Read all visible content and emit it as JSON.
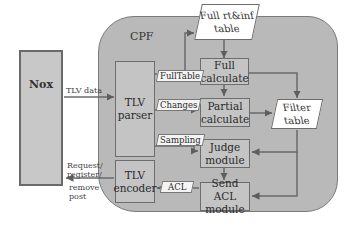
{
  "diagram": {
    "container": {
      "label": "CPF",
      "fill": "#b9b9b9"
    },
    "external": {
      "label": "Nox"
    },
    "nodes": {
      "tlv_parser": {
        "line1": "TLV",
        "line2": "parser"
      },
      "tlv_encoder": {
        "line1": "TLV",
        "line2": "encoder"
      },
      "full_table": {
        "line1": "Full  rt&inf",
        "line2": "table"
      },
      "full_calculate": {
        "line1": "Full",
        "line2": "calculate"
      },
      "partial_calculate": {
        "line1": "Partial",
        "line2": "calculate"
      },
      "judge_module": {
        "line1": "Judge",
        "line2": "module"
      },
      "send_acl_module": {
        "line1": "Send ACL",
        "line2": "module"
      },
      "filter_table": {
        "line1": "Filter",
        "line2": "table"
      }
    },
    "edge_labels": {
      "tlv_data": "TLV data",
      "request": "Request/",
      "register": "register/",
      "remove": "remove",
      "post": "post",
      "fulltable": "FullTable",
      "changes": "Changes",
      "sampling": "Sampling",
      "acl": "ACL"
    },
    "edges": [
      {
        "from": "Nox",
        "to": "TLV parser",
        "label": "TLV data"
      },
      {
        "from": "TLV parser",
        "to": "Full rt&inf table",
        "label": "FullTable"
      },
      {
        "from": "TLV parser",
        "to": "Partial calculate",
        "label": "Changes"
      },
      {
        "from": "TLV parser",
        "to": "Judge module",
        "label": "Sampling"
      },
      {
        "from": "Full rt&inf table",
        "to": "Full calculate"
      },
      {
        "from": "Full calculate",
        "to": "Partial calculate"
      },
      {
        "from": "Full calculate",
        "to": "Filter table"
      },
      {
        "from": "Partial calculate",
        "to": "Filter table"
      },
      {
        "from": "Filter table",
        "to": "Judge module"
      },
      {
        "from": "Filter table",
        "to": "Send ACL module"
      },
      {
        "from": "Judge module",
        "to": "Send ACL module"
      },
      {
        "from": "Send ACL module",
        "to": "TLV encoder",
        "label": "ACL"
      },
      {
        "from": "TLV encoder",
        "to": "Nox",
        "label": "Request/register/remove post"
      }
    ]
  }
}
